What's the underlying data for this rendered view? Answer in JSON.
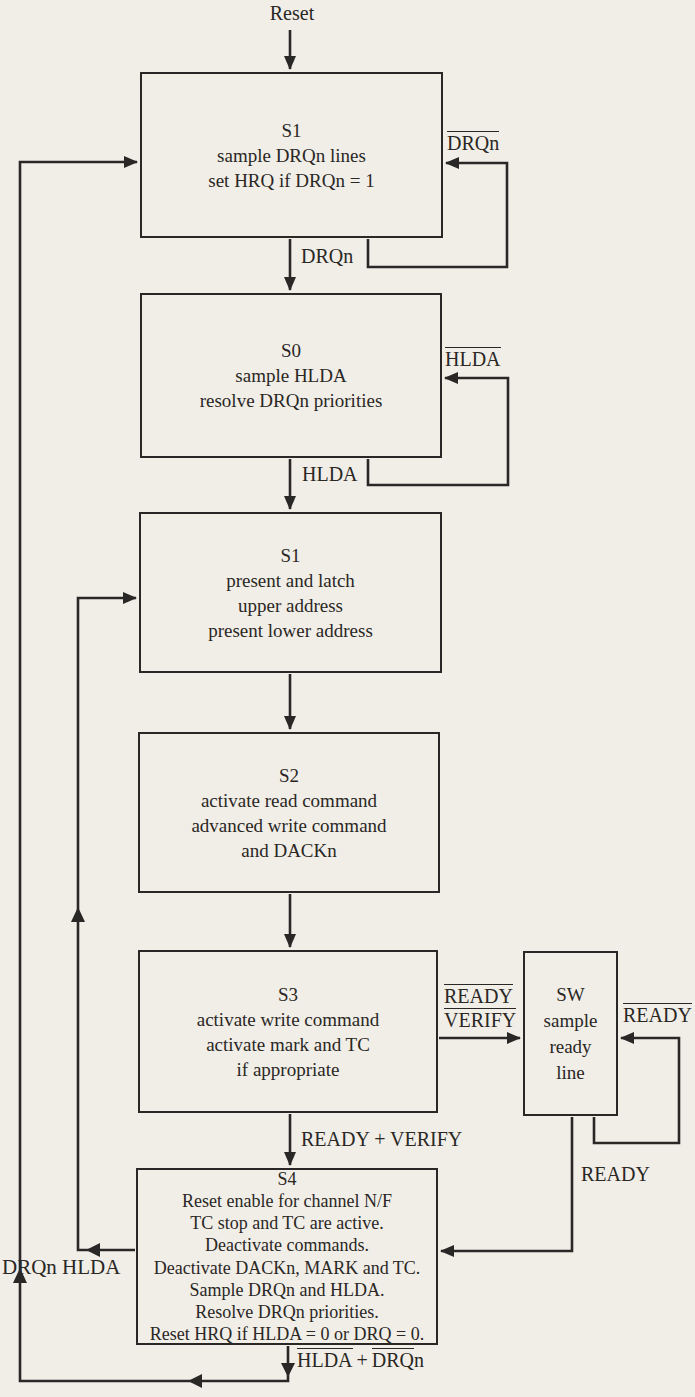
{
  "diagram": {
    "kind": "DMA controller state flowchart",
    "bg_color": "#f1eee8",
    "ink_color": "#2a2826",
    "reset_label": "Reset",
    "boxes": {
      "si": {
        "title": "S1",
        "lines": [
          "sample DRQn lines",
          "set HRQ if DRQn = 1"
        ]
      },
      "s0": {
        "title": "S0",
        "lines": [
          "sample HLDA",
          "resolve DRQn priorities"
        ]
      },
      "s1": {
        "title": "S1",
        "lines": [
          "present and latch",
          "upper address",
          "present lower address"
        ]
      },
      "s2": {
        "title": "S2",
        "lines": [
          "activate read command",
          "advanced write command",
          "and DACKn"
        ]
      },
      "s3": {
        "title": "S3",
        "lines": [
          "activate write command",
          "activate mark and TC",
          "if appropriate"
        ]
      },
      "sw": {
        "title": "SW",
        "lines": [
          "sample",
          "ready",
          "line"
        ]
      },
      "s4": {
        "title": "S4",
        "lines": [
          "Reset enable for channel N/F",
          "TC stop and TC are active.",
          "Deactivate commands.",
          "Deactivate DACKn, MARK and TC.",
          "Sample DRQn and HLDA.",
          "Resolve DRQn priorities.",
          "Reset HRQ if HLDA = 0 or DRQ = 0."
        ]
      }
    },
    "labels": {
      "si_loop_overlined": "DRQn",
      "si_exit": "DRQn",
      "s0_loop_overlined": "HLDA",
      "s0_exit": "HLDA",
      "s3_wait_line1_overlined": "READY",
      "s3_wait_line2_overlined": "VERIFY",
      "sw_loop_overlined": "READY",
      "sw_exit": "READY",
      "s3_exit": "READY + VERIFY",
      "s4_left_exit": "DRQn HLDA",
      "s4_bottom_p1_overlined": "HLDA",
      "s4_bottom_p2": "+",
      "s4_bottom_p3_overlined": "DRQ",
      "s4_bottom_p4": "n"
    }
  }
}
